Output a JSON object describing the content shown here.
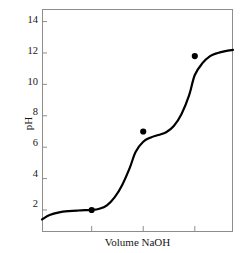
{
  "chart_data": {
    "type": "line",
    "title": "",
    "xlabel": "Volume NaOH",
    "ylabel": "pH",
    "ylim": [
      0.6,
      14.8
    ],
    "xlim": [
      0,
      100
    ],
    "grid": false,
    "legend": null,
    "ytick_labels": [
      "14",
      "12",
      "10",
      "8",
      "6",
      "4",
      "2"
    ],
    "ytick_values": [
      14,
      12,
      10,
      8,
      6,
      4,
      2
    ],
    "xtick_labels": [
      "",
      "",
      ""
    ],
    "xtick_values": [
      26,
      53,
      80
    ],
    "series": [
      {
        "name": "titration curve",
        "x": [
          0,
          4,
          9,
          14,
          19,
          23,
          26,
          30,
          34,
          38,
          42,
          46,
          49,
          53,
          57,
          61,
          65,
          69,
          73,
          77,
          80,
          84,
          88,
          92,
          96,
          100
        ],
        "y": [
          1.4,
          1.68,
          1.85,
          1.93,
          1.97,
          1.99,
          2.0,
          2.08,
          2.3,
          2.8,
          3.6,
          4.7,
          5.7,
          6.35,
          6.62,
          6.78,
          6.95,
          7.35,
          8.1,
          9.3,
          10.6,
          11.35,
          11.8,
          12.0,
          12.12,
          12.2
        ]
      }
    ],
    "markers": [
      {
        "x": 26,
        "y": 2.0,
        "label": "first equivalence point"
      },
      {
        "x": 53,
        "y": 7.0,
        "label": "second equivalence point"
      },
      {
        "x": 80,
        "y": 11.8,
        "label": "third equivalence point"
      }
    ],
    "curve_color": "#000000",
    "axis_color": "#8d8d8d",
    "marker_color": "#000000"
  }
}
